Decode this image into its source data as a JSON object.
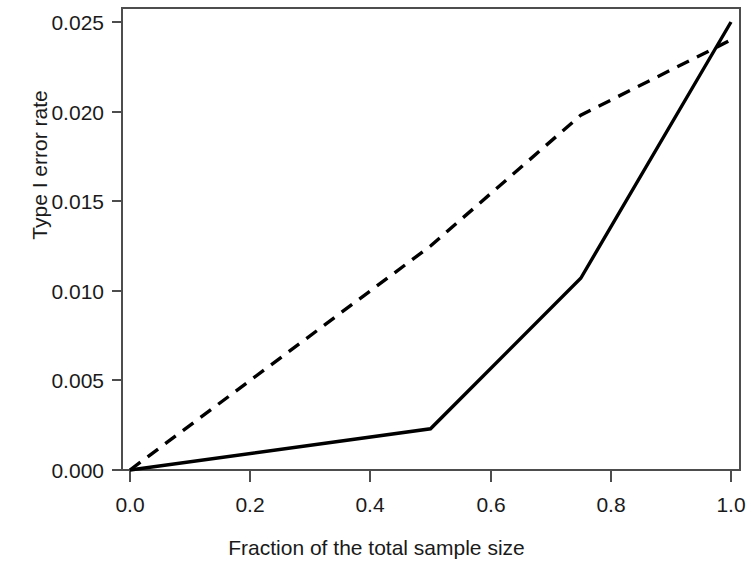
{
  "chart_data": {
    "type": "line",
    "title": "",
    "xlabel": "Fraction of the total sample size",
    "ylabel": "Type I error rate",
    "xlim": [
      0.0,
      1.0
    ],
    "ylim": [
      0.0,
      0.025
    ],
    "xticks": [
      0.0,
      0.2,
      0.4,
      0.6,
      0.8,
      1.0
    ],
    "xtick_labels": [
      "0.0",
      "0.2",
      "0.4",
      "0.6",
      "0.8",
      "1.0"
    ],
    "yticks": [
      0.0,
      0.005,
      0.01,
      0.015,
      0.02,
      0.025
    ],
    "ytick_labels": [
      "0.000",
      "0.005",
      "0.010",
      "0.015",
      "0.020",
      "0.025"
    ],
    "grid": false,
    "legend": null,
    "series": [
      {
        "name": "dashed",
        "linestyle": "dashed",
        "color": "#000000",
        "x": [
          0.0,
          0.5,
          0.75,
          1.0
        ],
        "values": [
          0.0,
          0.0125,
          0.0198,
          0.024
        ]
      },
      {
        "name": "solid",
        "linestyle": "solid",
        "color": "#000000",
        "x": [
          0.0,
          0.5,
          0.75,
          1.0
        ],
        "values": [
          0.0,
          0.0023,
          0.0107,
          0.025
        ]
      }
    ]
  },
  "axes": {
    "x_tick_labels": [
      "0.0",
      "0.2",
      "0.4",
      "0.6",
      "0.8",
      "1.0"
    ],
    "y_tick_labels": [
      "0.000",
      "0.005",
      "0.010",
      "0.015",
      "0.020",
      "0.025"
    ],
    "x_axis_title": "Fraction of the total sample size",
    "y_axis_title": "Type I error rate"
  },
  "style": {
    "line_color": "#000000",
    "axis_color": "#4d4d4d",
    "background": "#ffffff"
  }
}
